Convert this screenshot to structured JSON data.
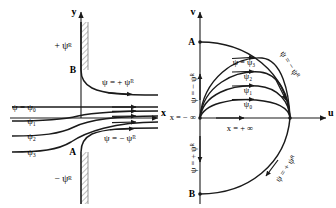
{
  "figure": {
    "stroke_color": "#1a1a1a",
    "hatch_color": "#7d7d7d"
  },
  "left_panel": {
    "name": "physical-plane",
    "axis_y_label": "y",
    "axis_x_label": "x",
    "point_a_label": "A",
    "point_b_label": "B",
    "wall_top_label": "+ ψᴿ",
    "wall_bottom_label": "− ψᴿ",
    "streamline_top_label": "ψ = + ψᴿ",
    "streamline_bottom_label": "ψ = − ψᴿ",
    "streamlines": [
      {
        "label": "ψ = ψ₀"
      },
      {
        "label": "ψ₁"
      },
      {
        "label": "ψ₂"
      },
      {
        "label": "ψ₃"
      }
    ]
  },
  "right_panel": {
    "name": "hodograph-plane",
    "axis_v_label": "v",
    "axis_u_label": "u",
    "point_a_label": "A",
    "point_b_label": "B",
    "axis_left_label": "ψ = − ψᴿ",
    "axis_lower_label": "ψ = + ψᴿ",
    "arc_outer_top_label": "ψ = − ψᴿ",
    "arc_outer_bottom_label": "ψ = + ψᴿ",
    "x_minus_infinity": "x = − ∞",
    "x_plus_infinity": "x = + ∞",
    "arcs": [
      {
        "label": "ψ = ψ₃"
      },
      {
        "label": "ψ₂"
      },
      {
        "label": "ψ₁"
      },
      {
        "label": "ψ₀"
      }
    ]
  }
}
